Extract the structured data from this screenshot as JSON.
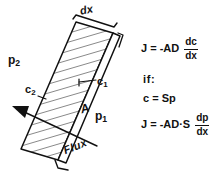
{
  "figure": {
    "background_color": "#ffffff",
    "ink_color": "#111111",
    "hatch_color": "#6b6b6b"
  },
  "diagram": {
    "slab": {
      "label_thickness": "dx",
      "label_area": "A",
      "orientation_note": "tilted parallelogram slab with diagonal hatching"
    },
    "labels": {
      "p2": {
        "base": "p",
        "sub": "2"
      },
      "c2": {
        "base": "c",
        "sub": "2"
      },
      "c1": {
        "base": "c",
        "sub": "1"
      },
      "p1": {
        "base": "p",
        "sub": "1"
      },
      "area": "A",
      "thickness": "dx",
      "flux": "Flux"
    }
  },
  "equations": [
    {
      "id": "fick-concentration",
      "lhs": "J = -AD",
      "numerator": "dc",
      "denominator": "dx"
    },
    {
      "id": "if-condition",
      "lhs": "if:",
      "numerator": "",
      "denominator": ""
    },
    {
      "id": "solubility",
      "lhs": "c = Sp",
      "numerator": "",
      "denominator": ""
    },
    {
      "id": "fick-pressure",
      "lhs": "J = -AD·S",
      "numerator": "dp",
      "denominator": "dx"
    }
  ]
}
